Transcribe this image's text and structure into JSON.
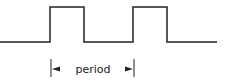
{
  "diagram": {
    "title": "",
    "type": "square-wave",
    "stroke_color": "#222222",
    "waveform": {
      "low_y": 42,
      "high_y": 7,
      "points": [
        [
          0,
          42
        ],
        [
          50,
          42
        ],
        [
          50,
          7
        ],
        [
          84,
          7
        ],
        [
          84,
          42
        ],
        [
          133,
          42
        ],
        [
          133,
          7
        ],
        [
          167,
          7
        ],
        [
          167,
          42
        ],
        [
          217,
          42
        ]
      ]
    },
    "period_marker": {
      "label": "period",
      "start_x": 51,
      "end_x": 134
    }
  }
}
